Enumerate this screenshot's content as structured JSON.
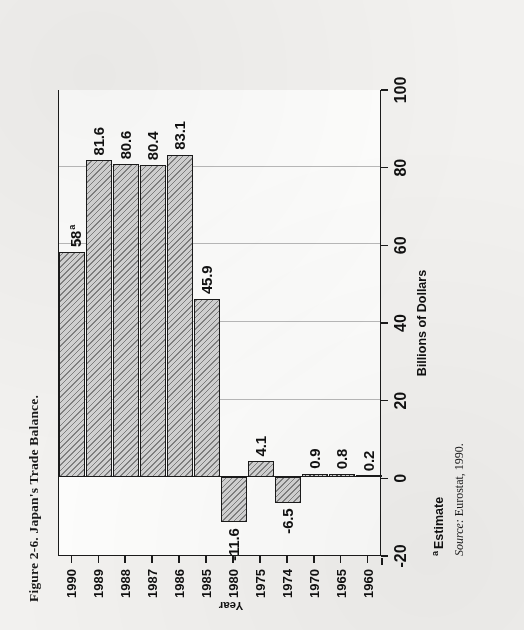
{
  "figure": {
    "caption": "Figure 2-6. Japan's Trade Balance.",
    "footnote_marker": "a",
    "footnote_text": "Estimate",
    "source_label": "Source:",
    "source_text": "Eurostat, 1990."
  },
  "chart_data": {
    "type": "bar",
    "orientation": "horizontal",
    "title": "Figure 2-6. Japan's Trade Balance.",
    "xlabel": "Year",
    "ylabel": "Billions of Dollars",
    "ylim": [
      -20,
      100
    ],
    "yticks": [
      "100",
      "80",
      "60",
      "40",
      "20",
      "0",
      "-20"
    ],
    "ytick_values": [
      100,
      80,
      60,
      40,
      20,
      0,
      -20
    ],
    "grid": true,
    "legend": "none",
    "categories": [
      "1960",
      "1965",
      "1970",
      "1974",
      "1975",
      "1980",
      "1985",
      "1986",
      "1987",
      "1988",
      "1989",
      "1990"
    ],
    "values": [
      0.2,
      0.8,
      0.9,
      -6.5,
      4.1,
      -11.6,
      45.9,
      83.1,
      80.4,
      80.6,
      81.6,
      58
    ],
    "data_labels": [
      "0.2",
      "0.8",
      "0.9",
      "-6.5",
      "4.1",
      "-11.6",
      "45.9",
      "83.1",
      "80.4",
      "80.6",
      "81.6",
      "58"
    ],
    "annotations": [
      {
        "category": "1990",
        "marker": "a",
        "note": "Estimate"
      }
    ],
    "bar_fill": "#d2d2d2",
    "bar_edge": "#1b1b1b",
    "grid_color": "#b9b9b9"
  },
  "bars": [
    {
      "year": "1960",
      "value": 0.2,
      "label": "0.2",
      "sup": ""
    },
    {
      "year": "1965",
      "value": 0.8,
      "label": "0.8",
      "sup": ""
    },
    {
      "year": "1970",
      "value": 0.9,
      "label": "0.9",
      "sup": ""
    },
    {
      "year": "1974",
      "value": -6.5,
      "label": "-6.5",
      "sup": ""
    },
    {
      "year": "1975",
      "value": 4.1,
      "label": "4.1",
      "sup": ""
    },
    {
      "year": "1980",
      "value": -11.6,
      "label": "-11.6",
      "sup": ""
    },
    {
      "year": "1985",
      "value": 45.9,
      "label": "45.9",
      "sup": ""
    },
    {
      "year": "1986",
      "value": 83.1,
      "label": "83.1",
      "sup": ""
    },
    {
      "year": "1987",
      "value": 80.4,
      "label": "80.4",
      "sup": ""
    },
    {
      "year": "1988",
      "value": 80.6,
      "label": "80.6",
      "sup": ""
    },
    {
      "year": "1989",
      "value": 81.6,
      "label": "81.6",
      "sup": ""
    },
    {
      "year": "1990",
      "value": 58,
      "label": "58",
      "sup": "a"
    }
  ]
}
